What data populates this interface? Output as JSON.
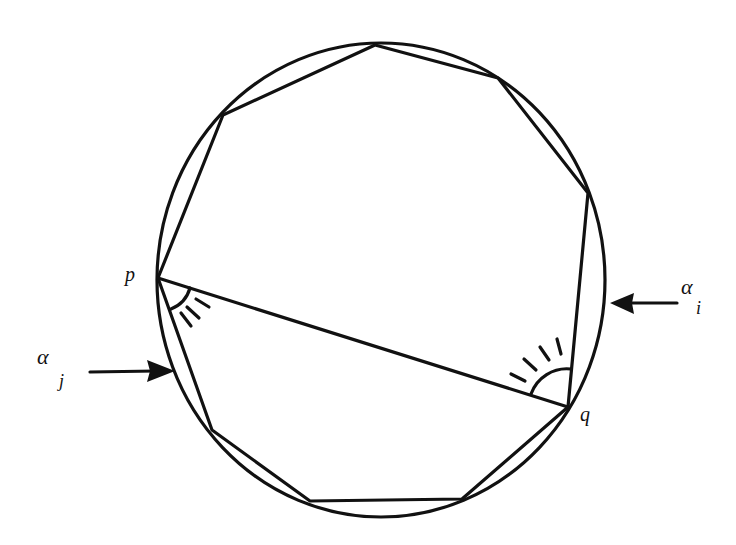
{
  "diagram": {
    "colors": {
      "stroke": "#111111",
      "background": "#ffffff"
    },
    "circle": {
      "cx": 381,
      "cy": 280,
      "rx": 224,
      "ry": 237
    },
    "polygon_vertices": [
      [
        375,
        45
      ],
      [
        498,
        78
      ],
      [
        588,
        193
      ],
      [
        568,
        407
      ],
      [
        462,
        499
      ],
      [
        310,
        501
      ],
      [
        212,
        430
      ],
      [
        158,
        278
      ],
      [
        223,
        115
      ]
    ],
    "chord": {
      "from": "p",
      "to": "q"
    },
    "points": {
      "p": {
        "label": "p",
        "x": 158,
        "y": 278
      },
      "q": {
        "label": "q",
        "x": 568,
        "y": 407
      }
    },
    "arrows": [
      {
        "id": "alpha_i",
        "symbol": "α",
        "subscript": "i",
        "tail": [
          677,
          303
        ],
        "tip": [
          610,
          303
        ]
      },
      {
        "id": "alpha_j",
        "symbol": "α",
        "subscript": "j",
        "tail": [
          90,
          372
        ],
        "tip": [
          175,
          371
        ]
      }
    ],
    "angle_marks": [
      {
        "at": "p",
        "ticks": 3
      },
      {
        "at": "q",
        "ticks": 4
      }
    ]
  }
}
